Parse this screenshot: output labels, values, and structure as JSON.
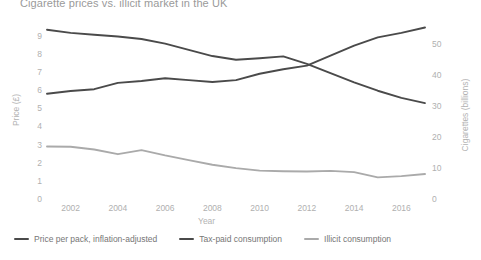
{
  "chart_data": {
    "type": "line",
    "title": "Cigarette prices vs. illicit market in the UK",
    "xlabel": "Year",
    "ylabel": "Price (£)",
    "ylabel_right": "Cigarettes (billions)",
    "x": [
      2001,
      2002,
      2003,
      2004,
      2005,
      2006,
      2007,
      2008,
      2009,
      2010,
      2011,
      2012,
      2013,
      2014,
      2015,
      2016,
      2017
    ],
    "xlim": [
      2001,
      2017
    ],
    "xticks": [
      2002,
      2004,
      2006,
      2008,
      2010,
      2012,
      2014,
      2016
    ],
    "ylim": [
      0,
      9.8
    ],
    "yticks": [
      0,
      1,
      2,
      3,
      4,
      5,
      6,
      7,
      8,
      9
    ],
    "ylim_right": [
      0,
      57.5
    ],
    "yticks_right": [
      0,
      10,
      20,
      30,
      40,
      50
    ],
    "grid": false,
    "legend_position": "bottom-left",
    "series": [
      {
        "name": "Price per pack, inflation-adjusted",
        "axis": "left",
        "color": "#4a4a4a",
        "values": [
          5.85,
          6.0,
          6.1,
          6.45,
          6.55,
          6.7,
          6.6,
          6.5,
          6.6,
          6.95,
          7.2,
          7.4,
          7.95,
          8.5,
          8.95,
          9.2,
          9.5
        ]
      },
      {
        "name": "Tax-paid consumption",
        "axis": "right",
        "color": "#4a4a4a",
        "values": [
          55.0,
          54.0,
          53.4,
          52.8,
          52.0,
          50.5,
          48.5,
          46.5,
          45.3,
          45.8,
          46.4,
          44.0,
          41.0,
          38.0,
          35.3,
          33.0,
          31.3
        ]
      },
      {
        "name": "Illicit consumption",
        "axis": "right",
        "color": "#aaaaaa",
        "values": [
          17.3,
          17.2,
          16.3,
          14.8,
          16.1,
          14.4,
          12.9,
          11.4,
          10.3,
          9.5,
          9.3,
          9.2,
          9.4,
          9.0,
          7.3,
          7.7,
          8.4
        ]
      }
    ]
  },
  "legend": {
    "items": [
      {
        "label": "Price per pack, inflation-adjusted",
        "color": "#4a4a4a"
      },
      {
        "label": "Tax-paid consumption",
        "color": "#4a4a4a"
      },
      {
        "label": "Illicit consumption",
        "color": "#aaaaaa"
      }
    ]
  }
}
